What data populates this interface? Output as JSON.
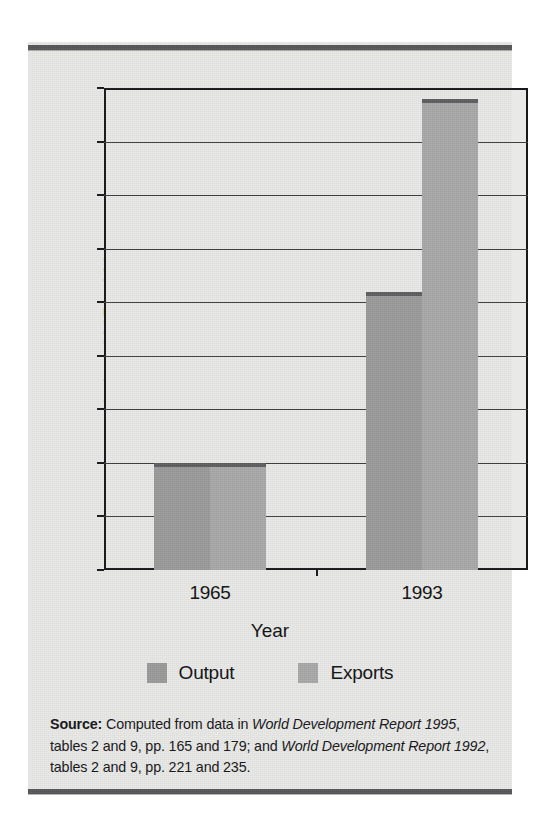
{
  "chart_data": {
    "type": "bar",
    "title": "",
    "xlabel": "Year",
    "ylabel": "Index, 1965 = 100",
    "categories": [
      "1965",
      "1993"
    ],
    "series": [
      {
        "name": "Output",
        "values": [
          100,
          260
        ],
        "color": "#9b9b9b"
      },
      {
        "name": "Exports",
        "values": [
          100,
          440
        ],
        "color": "#a9a9a9"
      }
    ],
    "ylim": [
      0,
      450
    ],
    "ytick_values": [
      0,
      50,
      100,
      150,
      200,
      250,
      300,
      350,
      400,
      450
    ],
    "ytick_labels": [
      "0",
      "50",
      "100",
      "150",
      "200",
      "250",
      "300",
      "350",
      "400",
      "450"
    ],
    "grid": true,
    "legend_position": "bottom"
  },
  "axis": {
    "y_title": "Index, 1965 = 100",
    "x_title": "Year",
    "x_tick_labels": [
      "1965",
      "1993"
    ]
  },
  "legend": {
    "items": [
      {
        "label": "Output",
        "color": "#9b9b9b"
      },
      {
        "label": "Exports",
        "color": "#a9a9a9"
      }
    ]
  },
  "source": {
    "label": "Source:",
    "line1_a": " Computed from data in ",
    "line1_italic": "World Development Report 1995",
    "line1_b": ", tables 2 and 9, pp. 165 and 179; and ",
    "line2_italic": "World Development Report 1992",
    "line2_b": ", tables 2 and 9, pp. 221 and 235."
  },
  "style": {
    "rule_color": "#58585a",
    "background": "#e9e9e7",
    "axis_color": "#19191b",
    "bar_cap_color": "#5f5f61"
  }
}
